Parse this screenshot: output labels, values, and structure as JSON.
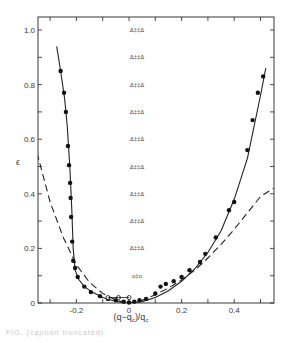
{
  "chart_data": {
    "type": "scatter",
    "title": "",
    "xlabel": "(q - q_c)/q_c",
    "ylabel": "ε",
    "xlim": [
      -0.35,
      0.55
    ],
    "ylim": [
      0,
      1.05
    ],
    "grid": false,
    "legend": null,
    "x_ticks": [
      -0.2,
      0,
      0.2,
      0.4
    ],
    "x_tick_labels": [
      "-0.2",
      "0",
      "0.2",
      "0.4"
    ],
    "x_minor_ticks": [
      -0.3,
      -0.1,
      0.1,
      0.3,
      0.5
    ],
    "y_ticks": [
      0,
      0.2,
      0.4,
      0.6,
      0.8,
      1.0
    ],
    "y_tick_labels": [
      "0",
      "0.2",
      "0.4",
      "0.6",
      "0.8",
      "1.0"
    ],
    "y_minor_ticks": [
      0.1,
      0.3,
      0.5,
      0.7,
      0.9
    ],
    "series": [
      {
        "name": "filled circles (left branch)",
        "kind": "points",
        "marker": "filled-circle",
        "x": [
          -0.26,
          -0.247,
          -0.24,
          -0.232,
          -0.228,
          -0.224,
          -0.222,
          -0.22,
          -0.216,
          -0.212,
          -0.205,
          -0.195,
          -0.17,
          -0.145,
          -0.11,
          -0.08,
          -0.05,
          -0.02,
          0.0
        ],
        "y": [
          0.85,
          0.77,
          0.7,
          0.575,
          0.505,
          0.44,
          0.385,
          0.315,
          0.225,
          0.155,
          0.128,
          0.095,
          0.06,
          0.04,
          0.025,
          0.015,
          0.01,
          0.005,
          0.002
        ]
      },
      {
        "name": "filled circles (right branch)",
        "kind": "points",
        "marker": "filled-circle",
        "x": [
          0.02,
          0.04,
          0.065,
          0.1,
          0.12,
          0.14,
          0.17,
          0.2,
          0.23,
          0.27,
          0.29,
          0.33,
          0.38,
          0.4,
          0.45,
          0.47,
          0.49,
          0.51
        ],
        "y": [
          0.005,
          0.01,
          0.015,
          0.035,
          0.06,
          0.07,
          0.08,
          0.095,
          0.12,
          0.15,
          0.18,
          0.24,
          0.34,
          0.37,
          0.56,
          0.67,
          0.77,
          0.83
        ]
      },
      {
        "name": "open circles with bar (near minimum)",
        "kind": "points",
        "marker": "open-circle-bar",
        "x": [
          -0.08,
          -0.04,
          0.0
        ],
        "y": [
          0.02,
          0.02,
          0.02
        ]
      },
      {
        "name": "solid fit (left steep)",
        "kind": "line",
        "style": "solid",
        "x": [
          -0.275,
          -0.26,
          -0.245,
          -0.235,
          -0.225,
          -0.218,
          -0.212,
          -0.205,
          -0.19,
          -0.17,
          -0.14,
          -0.1,
          -0.06,
          -0.02,
          0.0
        ],
        "y": [
          0.94,
          0.85,
          0.75,
          0.65,
          0.5,
          0.35,
          0.2,
          0.12,
          0.085,
          0.06,
          0.04,
          0.02,
          0.008,
          0.001,
          0.0
        ]
      },
      {
        "name": "solid fit (right)",
        "kind": "line",
        "style": "solid",
        "x": [
          0.0,
          0.05,
          0.1,
          0.15,
          0.2,
          0.25,
          0.3,
          0.35,
          0.4,
          0.45,
          0.5,
          0.52
        ],
        "y": [
          0.0,
          0.005,
          0.02,
          0.045,
          0.08,
          0.125,
          0.185,
          0.265,
          0.38,
          0.53,
          0.76,
          0.86
        ]
      },
      {
        "name": "dashed fit",
        "kind": "line",
        "style": "dashed",
        "x": [
          -0.35,
          -0.3,
          -0.25,
          -0.2,
          -0.15,
          -0.1,
          -0.05,
          0.0,
          0.05,
          0.1,
          0.15,
          0.2,
          0.25,
          0.3,
          0.35,
          0.4,
          0.45,
          0.5,
          0.55
        ],
        "y": [
          0.55,
          0.37,
          0.24,
          0.14,
          0.075,
          0.035,
          0.01,
          0.0,
          0.01,
          0.03,
          0.055,
          0.085,
          0.12,
          0.165,
          0.215,
          0.27,
          0.33,
          0.39,
          0.42
        ]
      },
      {
        "name": "triangle/bracket symbols column",
        "kind": "symbols",
        "marker": "triangle-bracket-column",
        "x": [
          0.0,
          0.0,
          0.0,
          0.0,
          0.0,
          0.0,
          0.0,
          0.0,
          0.0,
          0.0,
          0.0
        ],
        "y": [
          1.0,
          0.9,
          0.8,
          0.7,
          0.6,
          0.5,
          0.4,
          0.3,
          0.2,
          0.1,
          0.05
        ],
        "glyphs": [
          "Δ‡‡Δ",
          "Δ‡‡Δ",
          "Δ‡‡Δ",
          "Δ‡‡Δ",
          "Δ‡‡Δ",
          "Δ‡‡Δ",
          "Δ‡‡Δ",
          "Δ‡‡Δ",
          "Δ‡‡Δ",
          "o‡o",
          ""
        ]
      }
    ],
    "annotations": []
  },
  "figure": {
    "ylabel_text": "ε",
    "xlabel_text": "(q−q",
    "xlabel_sub": "c",
    "xlabel_mid": ")/q",
    "xlabel_sub2": "c",
    "caption_faint": "FIG. (caption truncated)"
  }
}
